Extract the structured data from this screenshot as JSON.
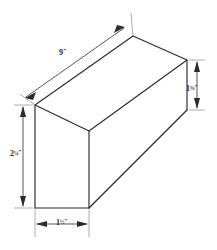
{
  "figure": {
    "shape": "rectangular-prism",
    "projection": "oblique-pictorial",
    "units": "inches",
    "line_color": "#2b2b2b",
    "dimension_line_color": "#3a3a3a",
    "extension_line_color": "#8a8a8a",
    "background_color": "#ffffff"
  },
  "dimensions": {
    "length": {
      "name": "length",
      "whole": "9",
      "fraction": "",
      "unit": "″",
      "full_label": "9″",
      "orientation": "diagonal",
      "position": "upper-left",
      "arrowheads": "both-ends"
    },
    "height_right": {
      "name": "right-height",
      "whole": "1",
      "fraction": "5/8",
      "unit": "″",
      "full_label": "1⅝″",
      "orientation": "vertical",
      "position": "right",
      "arrowheads": "both-ends"
    },
    "height_left": {
      "name": "left-height",
      "whole": "2",
      "fraction": "1/4",
      "unit": "″",
      "full_label": "2¼″",
      "orientation": "vertical",
      "position": "left",
      "arrowheads": "both-ends"
    },
    "width_bottom": {
      "name": "bottom-width",
      "whole": "1",
      "fraction": "1/2",
      "unit": "″",
      "full_label": "1½″",
      "orientation": "horizontal",
      "position": "bottom",
      "arrowheads": "both-ends"
    }
  }
}
